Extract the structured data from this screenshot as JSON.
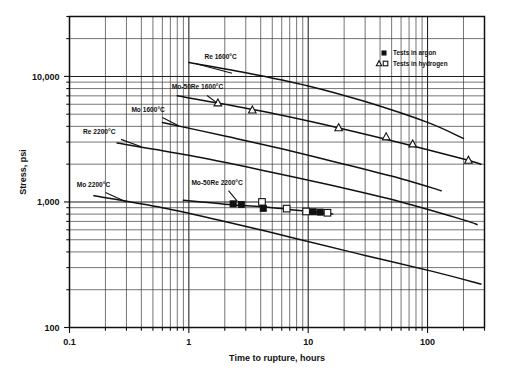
{
  "chart_data": {
    "type": "line",
    "title": "",
    "xlabel": "Time to rupture, hours",
    "ylabel": "Stress, psi",
    "xscale": "log",
    "yscale": "log",
    "xlim": [
      0.1,
      300
    ],
    "ylim": [
      100,
      30000
    ],
    "grid": true,
    "x_ticks": [
      "0.1",
      "1",
      "10",
      "100"
    ],
    "x_tick_values": [
      0.1,
      1,
      10,
      100
    ],
    "y_ticks": [
      "100",
      "1,000",
      "10,000"
    ],
    "y_tick_values": [
      100,
      1000,
      10000
    ],
    "legend": {
      "position": "top-right",
      "entries": [
        {
          "label": "Tests in argon",
          "markers": [
            "filled-square"
          ]
        },
        {
          "label": "Tests in hydrogen",
          "markers": [
            "open-triangle",
            "open-square"
          ]
        }
      ]
    },
    "series": [
      {
        "name": "Re 1600°C",
        "label": "Re 1600°C",
        "label_x": 1.35,
        "label_y": 13800,
        "leader_from": [
          1.15,
          12600
        ],
        "leader_to": [
          2.3,
          10600
        ],
        "points": [
          {
            "x": 1.0,
            "y": 12900
          },
          {
            "x": 3.0,
            "y": 10700
          },
          {
            "x": 10.0,
            "y": 8400
          },
          {
            "x": 30.0,
            "y": 6300
          },
          {
            "x": 100.0,
            "y": 4300
          },
          {
            "x": 200.0,
            "y": 3200
          }
        ],
        "markers": []
      },
      {
        "name": "Mo-50Re 1600°C",
        "label": "Mo-50Re 1600°C",
        "label_x": 0.72,
        "label_y": 7900,
        "leader_from": [
          1.42,
          7050
        ],
        "leader_to": [
          1.72,
          6150
        ],
        "points": [
          {
            "x": 0.8,
            "y": 7000
          },
          {
            "x": 2.0,
            "y": 6000
          },
          {
            "x": 6.0,
            "y": 4900
          },
          {
            "x": 20.0,
            "y": 3800
          },
          {
            "x": 60.0,
            "y": 2950
          },
          {
            "x": 200.0,
            "y": 2200
          },
          {
            "x": 280.0,
            "y": 2000
          }
        ],
        "markers": [
          {
            "x": 1.75,
            "y": 6150,
            "type": "open-triangle"
          },
          {
            "x": 3.4,
            "y": 5400,
            "type": "open-triangle"
          },
          {
            "x": 18.0,
            "y": 3900,
            "type": "open-triangle"
          },
          {
            "x": 45.0,
            "y": 3300,
            "type": "open-triangle"
          },
          {
            "x": 75.0,
            "y": 2900,
            "type": "open-triangle"
          },
          {
            "x": 220.0,
            "y": 2150,
            "type": "open-triangle"
          }
        ]
      },
      {
        "name": "Mo 1600°C",
        "label": "Mo 1600°C",
        "label_x": 0.33,
        "label_y": 5250,
        "leader_from": [
          0.6,
          4700
        ],
        "leader_to": [
          0.82,
          4050
        ],
        "points": [
          {
            "x": 0.6,
            "y": 4300
          },
          {
            "x": 2.0,
            "y": 3350
          },
          {
            "x": 6.0,
            "y": 2650
          },
          {
            "x": 20.0,
            "y": 2000
          },
          {
            "x": 60.0,
            "y": 1530
          },
          {
            "x": 130.0,
            "y": 1230
          }
        ],
        "markers": []
      },
      {
        "name": "Re 2200°C",
        "label": "Re 2200°C",
        "label_x": 0.13,
        "label_y": 3500,
        "leader_from": [
          0.27,
          3150
        ],
        "leader_to": [
          0.4,
          2750
        ],
        "points": [
          {
            "x": 0.25,
            "y": 2950
          },
          {
            "x": 1.0,
            "y": 2350
          },
          {
            "x": 4.0,
            "y": 1800
          },
          {
            "x": 15.0,
            "y": 1370
          },
          {
            "x": 60.0,
            "y": 1000
          },
          {
            "x": 200.0,
            "y": 720
          },
          {
            "x": 260.0,
            "y": 660
          }
        ],
        "markers": []
      },
      {
        "name": "Mo-50Re 2200°C",
        "label": "Mo-50Re 2200°C",
        "label_x": 1.05,
        "label_y": 1360,
        "leader_from": [
          2.15,
          1230
        ],
        "leader_to": [
          2.55,
          1010
        ],
        "points": [
          {
            "x": 0.9,
            "y": 1030
          },
          {
            "x": 2.0,
            "y": 960
          },
          {
            "x": 5.0,
            "y": 900
          },
          {
            "x": 10.0,
            "y": 840
          },
          {
            "x": 16.0,
            "y": 800
          }
        ],
        "markers": [
          {
            "x": 2.35,
            "y": 965,
            "type": "filled-square"
          },
          {
            "x": 2.75,
            "y": 955,
            "type": "filled-square"
          },
          {
            "x": 4.1,
            "y": 1000,
            "type": "open-square"
          },
          {
            "x": 4.2,
            "y": 890,
            "type": "filled-square"
          },
          {
            "x": 6.6,
            "y": 885,
            "type": "open-square"
          },
          {
            "x": 9.6,
            "y": 840,
            "type": "open-square"
          },
          {
            "x": 11.0,
            "y": 835,
            "type": "filled-square"
          },
          {
            "x": 12.6,
            "y": 830,
            "type": "filled-square"
          },
          {
            "x": 14.5,
            "y": 820,
            "type": "open-square"
          }
        ]
      },
      {
        "name": "Mo 2200°C",
        "label": "Mo 2200°C",
        "label_x": 0.115,
        "label_y": 1310,
        "leader_from": [
          0.2,
          1190
        ],
        "leader_to": [
          0.3,
          1000
        ],
        "points": [
          {
            "x": 0.16,
            "y": 1120
          },
          {
            "x": 0.6,
            "y": 900
          },
          {
            "x": 2.0,
            "y": 700
          },
          {
            "x": 8.0,
            "y": 510
          },
          {
            "x": 30.0,
            "y": 375
          },
          {
            "x": 110.0,
            "y": 280
          },
          {
            "x": 280.0,
            "y": 222
          }
        ],
        "markers": []
      }
    ]
  }
}
